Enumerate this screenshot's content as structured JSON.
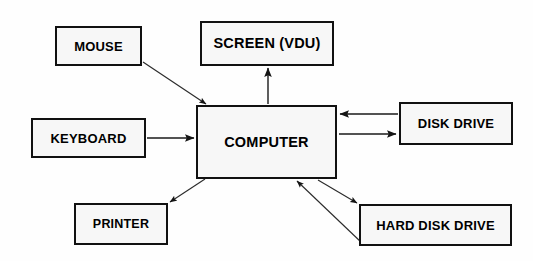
{
  "diagram": {
    "background_color": "#fefefe",
    "box_fill_color": "#f7f7f7",
    "box_border_color": "#111111",
    "connector_color": "#1a1a1a",
    "nodes": [
      {
        "id": "mouse",
        "label": "MOUSE"
      },
      {
        "id": "screen",
        "label": "SCREEN (VDU)"
      },
      {
        "id": "computer",
        "label": "COMPUTER"
      },
      {
        "id": "keyboard",
        "label": "KEYBOARD"
      },
      {
        "id": "diskdrive",
        "label": "DISK DRIVE"
      },
      {
        "id": "printer",
        "label": "PRINTER"
      },
      {
        "id": "harddisk",
        "label": "HARD DISK DRIVE"
      }
    ],
    "connectors": [
      {
        "from": "mouse",
        "to": "computer",
        "direction": "one-way"
      },
      {
        "from": "keyboard",
        "to": "computer",
        "direction": "one-way"
      },
      {
        "from": "computer",
        "to": "screen",
        "direction": "one-way"
      },
      {
        "from": "computer",
        "to": "printer",
        "direction": "one-way"
      },
      {
        "from": "diskdrive",
        "to": "computer",
        "direction": "one-way"
      },
      {
        "from": "computer",
        "to": "diskdrive",
        "direction": "one-way"
      },
      {
        "from": "computer",
        "to": "harddisk",
        "direction": "one-way"
      },
      {
        "from": "harddisk",
        "to": "computer",
        "direction": "one-way"
      }
    ]
  }
}
